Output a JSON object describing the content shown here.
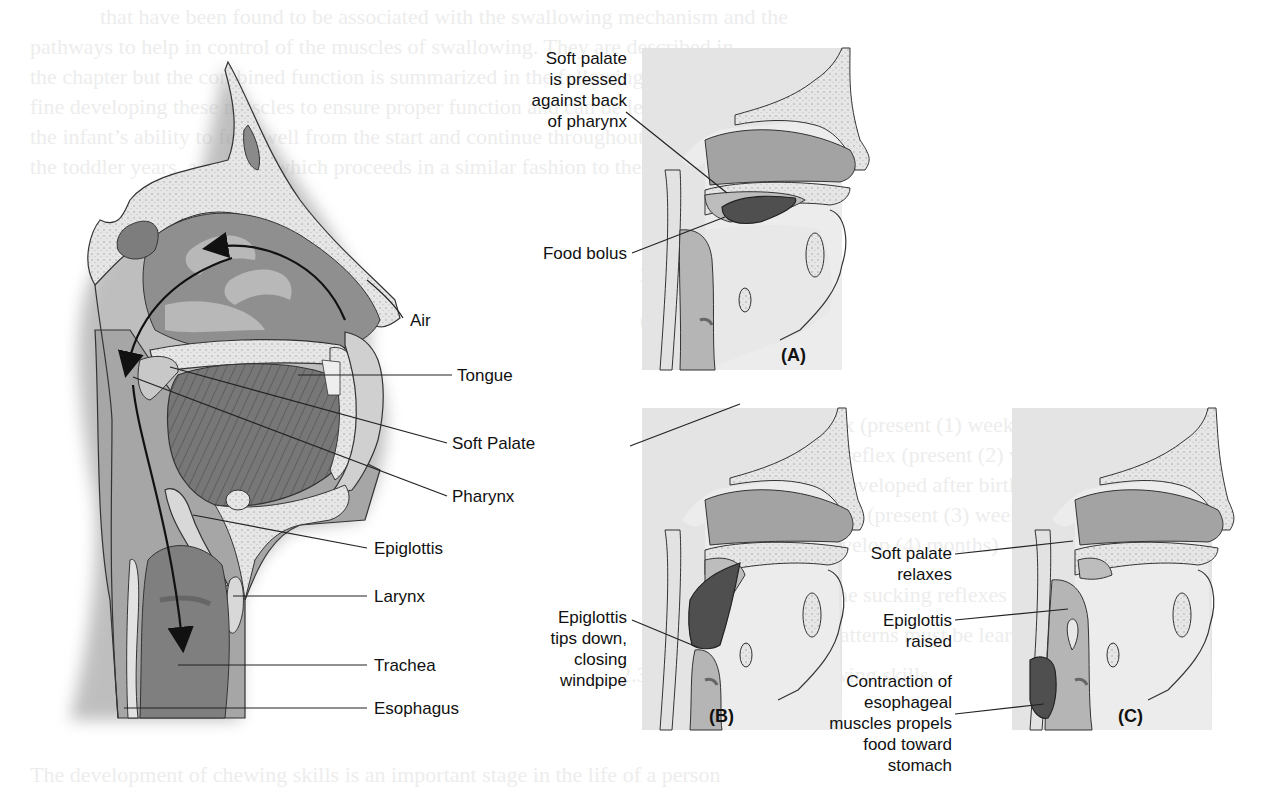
{
  "figure": {
    "main_diagram": {
      "labels": {
        "air": "Air",
        "tongue": "Tongue",
        "soft_palate": "Soft Palate",
        "pharynx": "Pharynx",
        "epiglottis": "Epiglottis",
        "larynx": "Larynx",
        "trachea": "Trachea",
        "esophagus": "Esophagus"
      }
    },
    "panels": {
      "a": {
        "letter": "(A)",
        "label_soft_palate": [
          "Soft palate",
          "is pressed",
          "against back",
          "of pharynx"
        ],
        "label_food_bolus": "Food bolus"
      },
      "b": {
        "letter": "(B)",
        "label_epiglottis": [
          "Epiglottis",
          "tips down,",
          "closing",
          "windpipe"
        ]
      },
      "c": {
        "letter": "(C)",
        "label_soft_palate": [
          "Soft palate",
          "relaxes"
        ],
        "label_epiglottis": [
          "Epiglottis",
          "raised"
        ],
        "label_contraction": [
          "Contraction of",
          "esophageal",
          "muscles propels",
          "food toward",
          "stomach"
        ]
      }
    }
  },
  "background_text": {
    "lines": [
      "that have been found to be associated with the swallowing mechanism and the",
      "pathways to help in control of the muscles of swallowing. They are described in",
      "the chapter but the combined function is summarized in the following figure.",
      "fine developing these muscles to ensure proper function and can be learned to weld",
      "the infant’s ability to feed well from the start and continue throughout",
      "the toddler years, a process which proceeds in a similar fashion to the breast milk",
      "",
      "",
      "2.2 Reflexes",
      "",
      "(a) Rooting reflex",
      "  (1) Head turning reflex (present (1) week)",
      "  (2) Suckling swallow reflex (present (2) weeks)",
      "  (3) Gag/ Bite reflex (developed after birth)",
      "  (4) Phasic tongue reflex (present (3) weeks)",
      "  (5) Other reflexes (develop (4) months)",
      "  The infant develops the sucking reflexes",
      "  Moving to chewing patterns must be learned",
      "2.3 Chewing and swallowing skills",
      "",
      "The development of chewing skills is an important stage in the life of a person"
    ]
  }
}
